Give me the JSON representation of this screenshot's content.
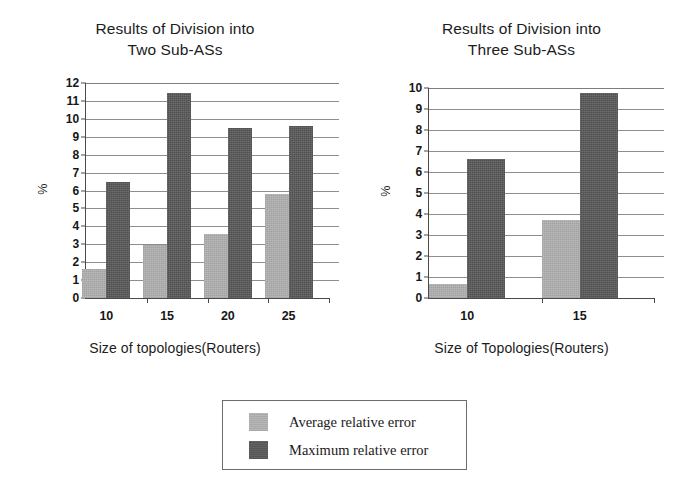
{
  "legend": {
    "entries": [
      {
        "label": "Average relative error",
        "color": "#b2b2b2",
        "key": "average"
      },
      {
        "label": "Maximum relative error",
        "color": "#5a5a5a",
        "key": "maximum"
      }
    ]
  },
  "charts": {
    "left": {
      "title": "Results of Division into\nTwo Sub-ASs",
      "ylabel": "%",
      "xlabel": "Size of topologies(Routers)",
      "yticks": [
        "0",
        "1",
        "2",
        "3",
        "4",
        "5",
        "6",
        "7",
        "8",
        "9",
        "10",
        "11",
        "12"
      ],
      "xticks": [
        "10",
        "15",
        "20",
        "25"
      ]
    },
    "right": {
      "title": "Results of Division into\nThree Sub-ASs",
      "ylabel": "%",
      "xlabel": "Size of Topologies(Routers)",
      "yticks": [
        "0",
        "1",
        "2",
        "3",
        "4",
        "5",
        "6",
        "7",
        "8",
        "9",
        "10"
      ],
      "xticks": [
        "10",
        "15"
      ]
    }
  },
  "chart_data": [
    {
      "type": "bar",
      "id": "two-sub-as",
      "title": "Results of Division into Two Sub-ASs",
      "xlabel": "Size of topologies(Routers)",
      "ylabel": "%",
      "categories": [
        "10",
        "15",
        "20",
        "25"
      ],
      "series": [
        {
          "name": "Average relative error",
          "color": "#b2b2b2",
          "values": [
            1.6,
            2.95,
            3.55,
            5.8
          ]
        },
        {
          "name": "Maximum relative error",
          "color": "#5a5a5a",
          "values": [
            6.5,
            11.45,
            9.5,
            9.6
          ]
        }
      ],
      "ylim": [
        0,
        12
      ],
      "ytick_step": 1,
      "grid": true,
      "legend_position": "below-center-shared"
    },
    {
      "type": "bar",
      "id": "three-sub-as",
      "title": "Results of Division into Three Sub-ASs",
      "xlabel": "Size of Topologies(Routers)",
      "ylabel": "%",
      "categories": [
        "10",
        "15"
      ],
      "series": [
        {
          "name": "Average relative error",
          "color": "#b2b2b2",
          "values": [
            0.65,
            3.7
          ]
        },
        {
          "name": "Maximum relative error",
          "color": "#5a5a5a",
          "values": [
            6.6,
            9.75
          ]
        }
      ],
      "ylim": [
        0,
        10
      ],
      "ytick_step": 1,
      "grid": true,
      "legend_position": "below-center-shared"
    }
  ]
}
